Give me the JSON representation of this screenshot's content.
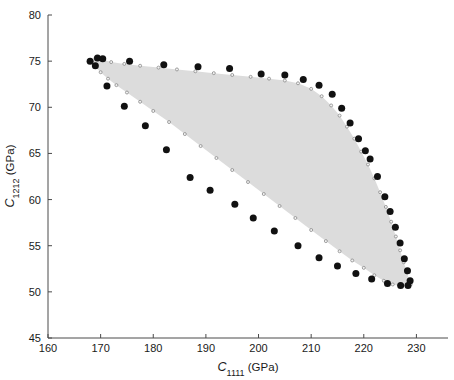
{
  "figure": {
    "background": "#ffffff",
    "region_fill": "#dcdcdc",
    "marker_color": "#111111",
    "outline_color": "#8a8a8a",
    "axis_color": "#4a4a4a"
  },
  "axes": {
    "x_title_symbol": "C",
    "x_title_sub": "1111",
    "x_title_unit": " (GPa)",
    "y_title_symbol": "C",
    "y_title_sub": "1212",
    "y_title_unit": " (GPa)",
    "x_ticks": [
      "160",
      "170",
      "180",
      "190",
      "200",
      "210",
      "220",
      "230"
    ],
    "y_ticks": [
      "45",
      "50",
      "55",
      "60",
      "65",
      "70",
      "75",
      "80"
    ]
  },
  "chart_data": {
    "type": "scatter",
    "title": "",
    "xlabel": "C_1111 (GPa)",
    "ylabel": "C_1212 (GPa)",
    "xlim": [
      160,
      236
    ],
    "ylim": [
      45,
      80
    ],
    "xticks": [
      160,
      170,
      180,
      190,
      200,
      210,
      220,
      230
    ],
    "yticks": [
      45,
      50,
      55,
      60,
      65,
      70,
      75,
      80
    ],
    "grid": false,
    "legend": null,
    "annotations": [],
    "series": [
      {
        "name": "region-boundary-outline",
        "marker": "open-circle-small",
        "color": "#8a8a8a",
        "fill": "#dcdcdc",
        "closed": true,
        "points": [
          [
            168.0,
            75.0
          ],
          [
            169.0,
            75.3
          ],
          [
            170.2,
            75.2
          ],
          [
            172.0,
            74.9
          ],
          [
            174.5,
            74.7
          ],
          [
            177.5,
            74.5
          ],
          [
            181.0,
            74.3
          ],
          [
            184.5,
            74.1
          ],
          [
            188.0,
            73.9
          ],
          [
            191.5,
            73.7
          ],
          [
            195.0,
            73.5
          ],
          [
            198.5,
            73.3
          ],
          [
            202.0,
            73.1
          ],
          [
            205.0,
            72.9
          ],
          [
            207.5,
            72.6
          ],
          [
            210.0,
            72.0
          ],
          [
            212.0,
            71.2
          ],
          [
            213.8,
            70.2
          ],
          [
            215.4,
            69.1
          ],
          [
            216.8,
            67.9
          ],
          [
            218.2,
            66.6
          ],
          [
            219.5,
            65.2
          ],
          [
            220.8,
            63.8
          ],
          [
            222.0,
            62.3
          ],
          [
            223.1,
            60.8
          ],
          [
            224.2,
            59.2
          ],
          [
            225.2,
            57.6
          ],
          [
            226.1,
            56.0
          ],
          [
            226.9,
            54.5
          ],
          [
            227.6,
            53.2
          ],
          [
            228.2,
            52.1
          ],
          [
            228.6,
            51.3
          ],
          [
            228.9,
            50.8
          ],
          [
            228.2,
            50.6
          ],
          [
            227.0,
            50.6
          ],
          [
            225.5,
            50.8
          ],
          [
            223.8,
            51.2
          ],
          [
            222.0,
            51.8
          ],
          [
            220.0,
            52.6
          ],
          [
            217.8,
            53.4
          ],
          [
            215.4,
            54.4
          ],
          [
            212.8,
            55.5
          ],
          [
            210.0,
            56.7
          ],
          [
            207.0,
            58.0
          ],
          [
            204.0,
            59.3
          ],
          [
            201.0,
            60.6
          ],
          [
            198.0,
            61.9
          ],
          [
            195.0,
            63.2
          ],
          [
            192.0,
            64.5
          ],
          [
            189.0,
            65.8
          ],
          [
            186.0,
            67.1
          ],
          [
            183.0,
            68.4
          ],
          [
            180.0,
            69.6
          ],
          [
            177.5,
            70.6
          ],
          [
            175.0,
            71.6
          ],
          [
            173.0,
            72.4
          ],
          [
            171.4,
            73.1
          ],
          [
            170.0,
            73.8
          ],
          [
            169.0,
            74.4
          ],
          [
            168.0,
            75.0
          ]
        ]
      },
      {
        "name": "upper-boundary-samples",
        "marker": "filled-circle-large",
        "color": "#111111",
        "points": [
          [
            168.0,
            75.0
          ],
          [
            169.4,
            75.35
          ],
          [
            170.4,
            75.25
          ],
          [
            175.5,
            75.0
          ],
          [
            182.0,
            74.6
          ],
          [
            188.5,
            74.4
          ],
          [
            194.5,
            74.2
          ],
          [
            200.5,
            73.6
          ],
          [
            205.0,
            73.5
          ],
          [
            208.5,
            73.0
          ],
          [
            211.5,
            72.4
          ],
          [
            214.0,
            71.4
          ],
          [
            215.8,
            69.9
          ],
          [
            217.4,
            68.3
          ],
          [
            219.0,
            66.6
          ],
          [
            220.3,
            65.3
          ],
          [
            221.2,
            64.4
          ],
          [
            222.6,
            62.5
          ],
          [
            224.0,
            60.3
          ],
          [
            225.0,
            58.7
          ],
          [
            226.0,
            57.0
          ],
          [
            226.9,
            55.3
          ],
          [
            227.7,
            53.6
          ],
          [
            228.3,
            52.3
          ],
          [
            228.8,
            51.2
          ],
          [
            228.4,
            50.7
          ]
        ]
      },
      {
        "name": "lower-boundary-samples",
        "marker": "filled-circle-large",
        "color": "#111111",
        "points": [
          [
            169.0,
            74.5
          ],
          [
            171.2,
            72.3
          ],
          [
            174.5,
            70.1
          ],
          [
            178.5,
            68.0
          ],
          [
            182.5,
            65.4
          ],
          [
            187.0,
            62.4
          ],
          [
            190.8,
            61.0
          ],
          [
            195.5,
            59.5
          ],
          [
            199.0,
            58.0
          ],
          [
            203.0,
            56.6
          ],
          [
            207.5,
            55.0
          ],
          [
            211.5,
            53.7
          ],
          [
            215.0,
            52.8
          ],
          [
            218.5,
            52.0
          ],
          [
            221.5,
            51.4
          ],
          [
            224.5,
            50.9
          ],
          [
            227.0,
            50.7
          ]
        ]
      }
    ]
  }
}
